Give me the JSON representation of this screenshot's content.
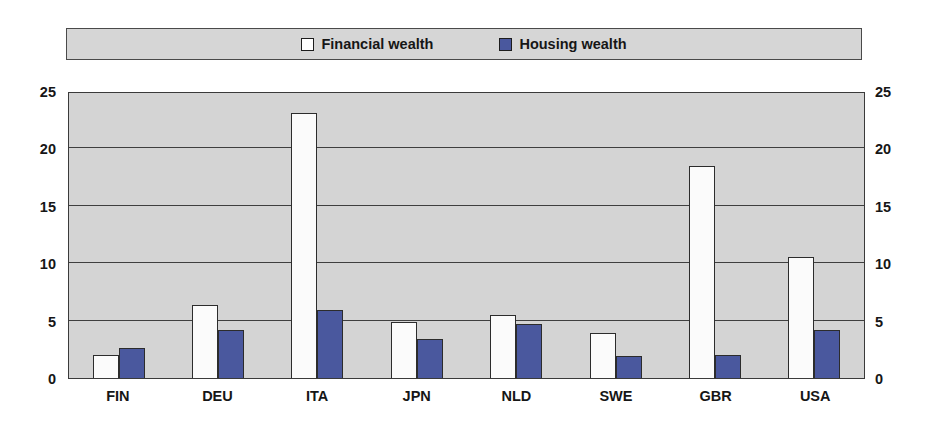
{
  "chart_data": {
    "type": "bar",
    "title": "",
    "subtitle": "",
    "xlabel": "",
    "ylabel": "",
    "ylim": [
      0,
      25
    ],
    "yticks": [
      0,
      5,
      10,
      15,
      20,
      25
    ],
    "grid": true,
    "legend_position": "top",
    "categories": [
      "FIN",
      "DEU",
      "ITA",
      "JPN",
      "NLD",
      "SWE",
      "GBR",
      "USA"
    ],
    "series": [
      {
        "name": "Financial wealth",
        "color": "#ffffff",
        "values": [
          2.0,
          6.4,
          23.1,
          4.9,
          5.5,
          3.9,
          18.5,
          10.5
        ]
      },
      {
        "name": "Housing wealth",
        "color": "#4a589e",
        "values": [
          2.6,
          4.2,
          5.9,
          3.4,
          4.7,
          1.9,
          2.0,
          4.2
        ]
      }
    ]
  },
  "legend": {
    "items": [
      {
        "label": "Financial wealth",
        "swatch": "financial"
      },
      {
        "label": "Housing wealth",
        "swatch": "housing"
      }
    ]
  },
  "colors": {
    "plot_background": "#d4d4d4",
    "legend_background": "#d6d6d6",
    "frame": "#3a3a3a",
    "gridline": "#3f3f3f",
    "financial_bar": "#ffffff",
    "housing_bar": "#4a589e",
    "text": "#161616"
  }
}
